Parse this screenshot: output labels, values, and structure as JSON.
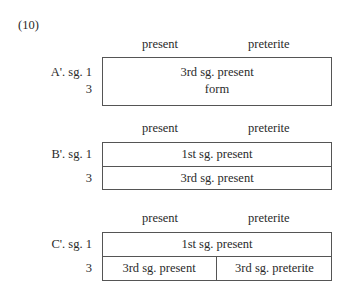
{
  "example_number": "(10)",
  "column_headers": {
    "present": "present",
    "preterite": "preterite"
  },
  "diagrams": [
    {
      "id": "A'",
      "row_labels": [
        "A'. sg. 1",
        "3"
      ],
      "cells": [
        "3rd sg. present",
        "form"
      ]
    },
    {
      "id": "B'",
      "row_labels": [
        "B'. sg. 1",
        "3"
      ],
      "cells": [
        "1st sg. present",
        "3rd sg. present"
      ]
    },
    {
      "id": "C'",
      "row_labels": [
        "C'. sg. 1",
        "3"
      ],
      "cells": [
        "1st sg. present",
        "3rd sg. present",
        "3rd sg. preterite"
      ]
    }
  ]
}
